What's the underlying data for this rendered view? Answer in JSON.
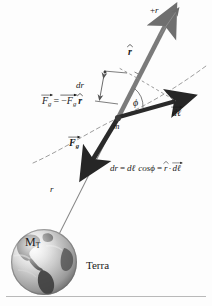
{
  "figure": {
    "domain_label": "physics-diagram",
    "background_color": "#fdfdfd",
    "width": 212,
    "height": 306
  },
  "labels": {
    "plus_r": "+r",
    "r_hat": "r",
    "dr": "dr",
    "phi": "ϕ",
    "d_ell": "dℓ",
    "mass": "m",
    "F_g_vector": "F",
    "F_g_sub": "g",
    "radius": "r",
    "earth_mass": "M",
    "earth_mass_sub": "T",
    "earth_name": "Terra"
  },
  "equations": {
    "force": {
      "lhs_symbol": "F",
      "lhs_sub": "g",
      "equals": "=",
      "minus": "−",
      "rhs_symbol": "F",
      "rhs_sub": "g",
      "rhs_unit": "r",
      "full_text": "F⃗g = −Fg r̂"
    },
    "projection": {
      "dr": "dr",
      "eq1": "=",
      "d_ell": "dℓ",
      "cos": "cos",
      "phi": "ϕ",
      "eq2": "=",
      "r_hat": "r",
      "dot": "·",
      "d_ell_vec": "dℓ",
      "full_text": "dr = dℓ cosϕ = r̂·dℓ⃗"
    }
  },
  "colors": {
    "r_hat_arrow": "#7b7b7b",
    "force_arrow": "#2a2a2a",
    "d_ell_arrow": "#2a2a2a",
    "radial_line": "#8a8a8a",
    "dashed_curve": "#9a9a9a",
    "construction_dashed": "#8e8e8e",
    "text": "#1a1a1a",
    "rule": "#b9b9b9",
    "earth_land": "#4a4a4a",
    "earth_ocean": "#d2d2d2"
  },
  "geometry": {
    "mass_point": [
      118,
      118
    ],
    "plus_r_arrow_tip": [
      174,
      14
    ],
    "force_arrow_tip": [
      89,
      166
    ],
    "d_ell_arrow_tip": [
      182,
      104
    ],
    "earth_center": [
      44,
      262
    ],
    "earth_radius": 33
  }
}
